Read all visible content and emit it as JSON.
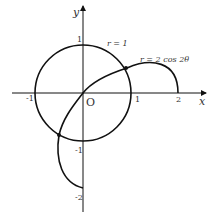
{
  "axes": {
    "x_label": "x",
    "y_label": "y",
    "origin_label": "O"
  },
  "ticks": {
    "x": [
      "-1",
      "1",
      "2"
    ],
    "y": [
      "1",
      "-1",
      "-2"
    ]
  },
  "curves": {
    "circle_label": "r = 1",
    "curve_label": "r = 2 cos 2θ"
  },
  "colors": {
    "stroke": "#111111",
    "text": "#333333"
  }
}
